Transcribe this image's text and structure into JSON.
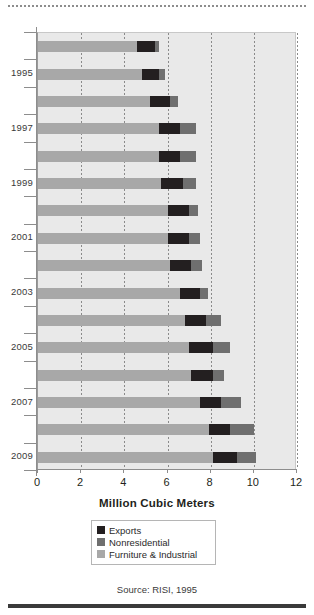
{
  "chart_data": {
    "type": "bar",
    "orientation": "horizontal",
    "stacked": true,
    "title": "",
    "xlabel": "Million Cubic Meters",
    "ylabel": "",
    "xlim": [
      0,
      12
    ],
    "xticks": [
      0,
      2,
      4,
      6,
      8,
      10,
      12
    ],
    "xticklabels": [
      "0",
      "2",
      "4",
      "6",
      "8",
      "10",
      "12"
    ],
    "grid": "vertical-dotted",
    "legend_position": "below-axis-center",
    "categories": [
      "1994",
      "1995",
      "1996",
      "1997",
      "1998",
      "1999",
      "2000",
      "2001",
      "2002",
      "2003",
      "2004",
      "2005",
      "2006",
      "2007",
      "2008",
      "2009"
    ],
    "visible_category_labels": [
      "1995",
      "1997",
      "1999",
      "2001",
      "2003",
      "2005",
      "2007",
      "2009"
    ],
    "series": [
      {
        "name": "Furniture & Industrial",
        "color": "#a8a8a8",
        "values": [
          4.6,
          4.8,
          5.2,
          5.6,
          5.6,
          5.7,
          6.0,
          6.0,
          6.1,
          6.6,
          6.8,
          7.0,
          7.1,
          7.5,
          7.9,
          8.1
        ]
      },
      {
        "name": "Exports",
        "color": "#231f20",
        "values": [
          0.8,
          0.8,
          0.9,
          1.0,
          1.0,
          1.0,
          1.0,
          1.0,
          1.0,
          0.9,
          1.0,
          1.1,
          1.0,
          1.0,
          1.0,
          1.1
        ]
      },
      {
        "name": "Nonresidential",
        "color": "#6f6f6f",
        "values": [
          0.2,
          0.3,
          0.4,
          0.7,
          0.7,
          0.6,
          0.4,
          0.5,
          0.5,
          0.4,
          0.7,
          0.8,
          0.5,
          0.9,
          1.1,
          0.9
        ]
      }
    ],
    "totals": [
      5.6,
      5.9,
      6.5,
      7.3,
      7.3,
      7.3,
      7.4,
      7.5,
      7.6,
      7.9,
      8.5,
      8.9,
      8.6,
      9.4,
      10.0,
      10.1
    ],
    "legend": [
      {
        "label": "Exports",
        "color": "#231f20"
      },
      {
        "label": "Nonresidential",
        "color": "#6f6f6f"
      },
      {
        "label": "Furniture & Industrial",
        "color": "#a8a8a8"
      }
    ]
  },
  "figure": {
    "source_note": "Source: RISI, 1995"
  }
}
